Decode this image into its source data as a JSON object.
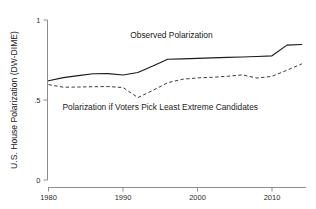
{
  "chart_data": {
    "type": "line",
    "title": "",
    "subtitle": "",
    "xlabel": "",
    "ylabel": "U.S. House Polarization (DW-DIME)",
    "xlim": [
      1979,
      1915
    ],
    "x_axis_min": 1979,
    "x_axis_max": 2015,
    "ylim": [
      0,
      1
    ],
    "grid": false,
    "legend": "inline-annotations",
    "x_ticks": [
      1980,
      1990,
      2000,
      2010
    ],
    "x_tick_labels": [
      "1980",
      "1990",
      "2000",
      "2010"
    ],
    "y_ticks": [
      0,
      0.5,
      1
    ],
    "y_tick_labels": [
      "0",
      ".5",
      "1"
    ],
    "annotations": [
      {
        "name": "observed-label",
        "text": "Observed Polarization",
        "x": 1996.5,
        "y": 0.885
      },
      {
        "name": "counterfactual-label",
        "text": "Polarization if Voters Pick Least Extreme Candidates",
        "x": 1995.0,
        "y": 0.435
      }
    ],
    "series": [
      {
        "name": "Observed Polarization",
        "style": "solid",
        "color": "#1a1a1a",
        "x": [
          1980,
          1982,
          1984,
          1986,
          1988,
          1990,
          1992,
          1994,
          1996,
          1998,
          2000,
          2002,
          2004,
          2006,
          2008,
          2010,
          2012,
          2014
        ],
        "values": [
          0.62,
          0.64,
          0.652,
          0.664,
          0.665,
          0.656,
          0.672,
          0.712,
          0.755,
          0.757,
          0.76,
          0.763,
          0.766,
          0.769,
          0.772,
          0.776,
          0.843,
          0.847
        ]
      },
      {
        "name": "Polarization if Voters Pick Least Extreme Candidates",
        "style": "dashed",
        "color": "#3a3a3a",
        "x": [
          1980,
          1982,
          1984,
          1986,
          1988,
          1990,
          1992,
          1994,
          1996,
          1998,
          2000,
          2002,
          2004,
          2006,
          2008,
          2010,
          2012,
          2014
        ],
        "values": [
          0.596,
          0.58,
          0.581,
          0.583,
          0.584,
          0.578,
          0.515,
          0.56,
          0.608,
          0.63,
          0.638,
          0.642,
          0.648,
          0.657,
          0.637,
          0.648,
          0.686,
          0.726
        ]
      }
    ]
  },
  "axis": {
    "y_title": "U.S. House Polarization (DW-DIME)"
  }
}
